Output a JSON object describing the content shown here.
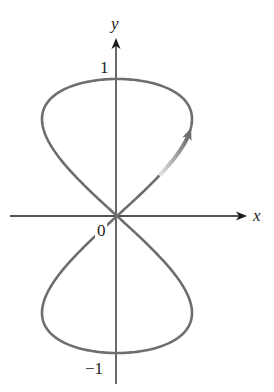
{
  "chart_data": {
    "type": "line",
    "title": "",
    "xlabel": "x",
    "ylabel": "y",
    "ytick_labels": [
      "1",
      "0",
      "−1"
    ],
    "yticks": [
      1,
      0,
      -1
    ],
    "origin_label": "0",
    "parametric": {
      "x_expr": "a*sin(2t)",
      "y_expr": "sin(t)",
      "a": 0.55,
      "t_range": [
        0,
        6.2832
      ]
    },
    "key_points": [
      {
        "label": "origin",
        "x": 0,
        "y": 0
      },
      {
        "label": "top",
        "x": 0,
        "y": 1
      },
      {
        "label": "bottom",
        "x": 0,
        "y": -1
      },
      {
        "label": "right extreme (upper)",
        "x": 0.55,
        "y": 0.707
      },
      {
        "label": "left extreme (upper)",
        "x": -0.55,
        "y": 0.707
      },
      {
        "label": "right extreme (lower)",
        "x": 0.55,
        "y": -0.707
      },
      {
        "label": "left extreme (lower)",
        "x": -0.55,
        "y": -0.707
      }
    ],
    "direction_arrow": {
      "on_branch": "upper-right",
      "t_from": 0.3,
      "t_to": 0.62,
      "direction": "increasing t (moving up and right)"
    },
    "grid": false,
    "legend": null
  },
  "axes": {
    "x_label": "x",
    "y_label": "y",
    "tick_1": "1",
    "tick_0": "0",
    "tick_neg1": "−1"
  },
  "colors": {
    "curve": "#6e6e6e",
    "axes": "#1a1a1a",
    "arrow_light": "#d8d8d8",
    "arrow_dark": "#6e6e6e"
  }
}
